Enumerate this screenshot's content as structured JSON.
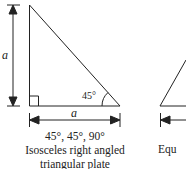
{
  "figure1": {
    "side_label_vertical": "a",
    "side_label_horizontal": "a",
    "angle_label": "45°",
    "caption_angles": "45°, 45°, 90°",
    "caption_line1": "Isosceles right angled",
    "caption_line2": "triangular plate"
  },
  "figure2": {
    "caption_partial": "Equ"
  },
  "colors": {
    "stroke": "#222222",
    "background": "#ffffff"
  }
}
